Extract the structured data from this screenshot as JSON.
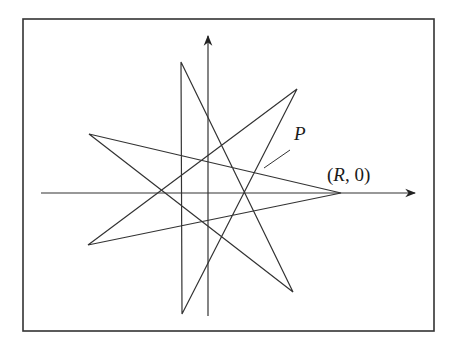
{
  "figure": {
    "frame": {
      "x": 23,
      "y": 19,
      "width": 411,
      "height": 312,
      "stroke": "#333333"
    },
    "axes": {
      "x_axis": {
        "x1": 41,
        "x2": 415,
        "y": 193
      },
      "y_axis": {
        "x": 208,
        "y1": 316,
        "y2": 36
      }
    },
    "star": {
      "stroke": "#333333",
      "vertices": [
        [
          341,
          193
        ],
        [
          89,
          134
        ],
        [
          293,
          292
        ],
        [
          181,
          62
        ],
        [
          182,
          314
        ],
        [
          297,
          89
        ],
        [
          88,
          245
        ]
      ]
    },
    "pointer_line": {
      "x1": 264,
      "y1": 168,
      "x2": 290,
      "y2": 150
    },
    "labels": {
      "point_p": "P",
      "point_r_open": "(",
      "point_r_var": "R",
      "point_r_rest": ", 0)"
    }
  }
}
